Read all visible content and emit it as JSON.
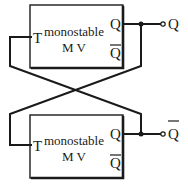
{
  "diagram": {
    "blocks": [
      {
        "id": "mv-top",
        "label_line1": "monostable",
        "label_line2": "M V",
        "input_pin": "T",
        "output_pin_q": "Q",
        "output_pin_qbar": "Q"
      },
      {
        "id": "mv-bottom",
        "label_line1": "monostable",
        "label_line2": "M V",
        "input_pin": "T",
        "output_pin_q": "Q",
        "output_pin_qbar": "Q"
      }
    ],
    "outputs": [
      {
        "label": "Q",
        "overbar": false
      },
      {
        "label": "Q",
        "overbar": true
      }
    ],
    "connections": [
      "top Q output feeds bottom T input (crossed wire)",
      "bottom Q output feeds top T input (crossed wire)"
    ]
  }
}
